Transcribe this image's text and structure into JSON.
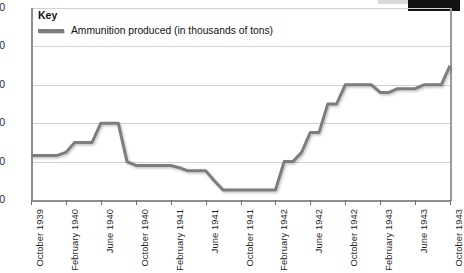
{
  "chart_data": {
    "type": "line",
    "title": "",
    "xlabel": "",
    "ylabel": "",
    "ylim": [
      0,
      250
    ],
    "yticks": [
      0,
      50,
      100,
      150,
      200,
      250
    ],
    "grid": true,
    "legend_position": "top-left",
    "legend_title": "Key",
    "series_name": "Ammunition produced  (in thousands of tons)",
    "series_color": "#7d7d7d",
    "xtick_labels": [
      "October 1939",
      "February 1940",
      "June 1940",
      "October 1940",
      "February 1941",
      "June 1941",
      "October 1941",
      "February 1942",
      "June 1942",
      "October 1942",
      "February 1943",
      "June 1943",
      "October 1943"
    ],
    "x_months": [
      "October 1939",
      "November 1939",
      "December 1939",
      "January 1940",
      "February 1940",
      "March 1940",
      "April 1940",
      "May 1940",
      "June 1940",
      "July 1940",
      "August 1940",
      "September 1940",
      "October 1940",
      "November 1940",
      "December 1940",
      "January 1941",
      "February 1941",
      "March 1941",
      "April 1941",
      "May 1941",
      "June 1941",
      "July 1941",
      "August 1941",
      "September 1941",
      "October 1941",
      "November 1941",
      "December 1941",
      "January 1942",
      "February 1942",
      "March 1942",
      "April 1942",
      "May 1942",
      "June 1942",
      "July 1942",
      "August 1942",
      "September 1942",
      "October 1942",
      "November 1942",
      "December 1942",
      "January 1943",
      "February 1943",
      "March 1943",
      "April 1943",
      "May 1943",
      "June 1943",
      "July 1943",
      "August 1943",
      "September 1943",
      "October 1943"
    ],
    "values": [
      58,
      58,
      58,
      58,
      62,
      75,
      75,
      75,
      100,
      100,
      100,
      50,
      45,
      45,
      45,
      45,
      45,
      42,
      38,
      38,
      38,
      25,
      13,
      13,
      13,
      13,
      13,
      13,
      13,
      50,
      50,
      62,
      88,
      88,
      125,
      125,
      150,
      150,
      150,
      150,
      140,
      140,
      145,
      145,
      145,
      150,
      150,
      150,
      175
    ]
  }
}
